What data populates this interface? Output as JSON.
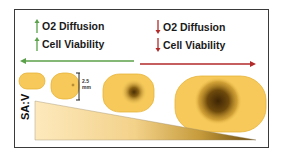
{
  "left_panel": {
    "trend": "increase",
    "arrow_color": "#5aa14a",
    "lines": [
      {
        "label": "O2 Diffusion",
        "arrow": "up-arrow"
      },
      {
        "label": "Cell Viability",
        "arrow": "up-arrow"
      }
    ],
    "direction_arrow": "left-arrow"
  },
  "right_panel": {
    "trend": "decrease",
    "arrow_color": "#b22a2a",
    "lines": [
      {
        "label": "O2 Diffusion",
        "arrow": "down-arrow"
      },
      {
        "label": "Cell Viability",
        "arrow": "down-arrow"
      }
    ],
    "direction_arrow": "right-arrow"
  },
  "spheroids": [
    {
      "size": "smallest",
      "core": "none"
    },
    {
      "size": "small",
      "core": "tiny"
    },
    {
      "size": "medium",
      "core": "moderate"
    },
    {
      "size": "large",
      "core": "large"
    }
  ],
  "scale_bar": {
    "value": "2.5",
    "unit": "mm"
  },
  "wedge": {
    "label": "SA:V"
  },
  "colors": {
    "cell_fill": "#f6c95a",
    "cell_edge": "#e8b43a",
    "core_dark": "#5a3a08",
    "wedge_light": "#fde8b8",
    "wedge_dark": "#7a5a14",
    "border": "#3a3a3a"
  }
}
